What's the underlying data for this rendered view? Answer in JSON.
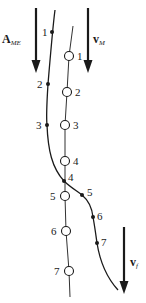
{
  "diagram": {
    "vectors": [
      {
        "id": "A_ME",
        "symbol": "A",
        "subscript": "ME",
        "x": 36,
        "y1": 8,
        "y2": 72,
        "label_x": 2,
        "label_y": 33
      },
      {
        "id": "v_M",
        "symbol": "v",
        "subscript": "M",
        "x": 88,
        "y1": 8,
        "y2": 72,
        "label_x": 93,
        "label_y": 33
      },
      {
        "id": "v_f",
        "symbol": "v",
        "subscript": "f",
        "x": 124,
        "y1": 227,
        "y2": 293,
        "label_x": 130,
        "label_y": 256
      }
    ],
    "filled_dot_path": {
      "label": "particle path (filled dots)",
      "points": [
        {
          "n": "1",
          "x": 52,
          "y": 32,
          "label_x": 42,
          "label_y": 27
        },
        {
          "n": "2",
          "x": 48,
          "y": 84,
          "label_x": 37,
          "label_y": 79
        },
        {
          "n": "3",
          "x": 47,
          "y": 125,
          "label_x": 36,
          "label_y": 120
        },
        {
          "n": "4",
          "x": 64,
          "y": 181,
          "label_x": 68,
          "label_y": 172
        },
        {
          "n": "5",
          "x": 82,
          "y": 195,
          "label_x": 87,
          "label_y": 187
        },
        {
          "n": "6",
          "x": 93,
          "y": 217,
          "label_x": 97,
          "label_y": 211
        },
        {
          "n": "7",
          "x": 97,
          "y": 243,
          "label_x": 101,
          "label_y": 237
        }
      ]
    },
    "open_circle_path": {
      "label": "medium path (open circles)",
      "points": [
        {
          "n": "1",
          "x": 69,
          "y": 56,
          "label_x": 77,
          "label_y": 51
        },
        {
          "n": "2",
          "x": 67,
          "y": 92,
          "label_x": 75,
          "label_y": 87
        },
        {
          "n": "3",
          "x": 65,
          "y": 125,
          "label_x": 73,
          "label_y": 120
        },
        {
          "n": "4",
          "x": 65,
          "y": 161,
          "label_x": 73,
          "label_y": 156
        },
        {
          "n": "5",
          "x": 65,
          "y": 196,
          "label_x": 50,
          "label_y": 191
        },
        {
          "n": "6",
          "x": 66,
          "y": 231,
          "label_x": 51,
          "label_y": 226
        },
        {
          "n": "7",
          "x": 69,
          "y": 271,
          "label_x": 54,
          "label_y": 266
        }
      ]
    },
    "colors": {
      "ink": "#1a1a1a",
      "background": "#ffffff"
    }
  }
}
